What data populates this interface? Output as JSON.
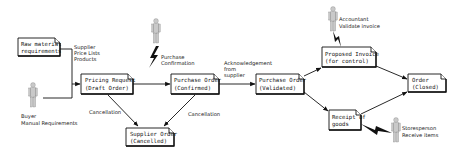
{
  "diagram": {
    "type": "workflow",
    "nodes": [
      {
        "id": "raw",
        "line1": "Raw material",
        "line2": "requirements",
        "x": 18,
        "y": 38,
        "w": 42,
        "h": 18
      },
      {
        "id": "pricing",
        "line1": "Pricing Request",
        "line2": "(Draft Order)",
        "x": 81,
        "y": 74,
        "w": 52,
        "h": 20
      },
      {
        "id": "confirmed",
        "line1": "Purchase Order",
        "line2": "(Confirmed)",
        "x": 171,
        "y": 74,
        "w": 48,
        "h": 20
      },
      {
        "id": "cancelled",
        "line1": "Supplier Order",
        "line2": "(Cancelled)",
        "x": 126,
        "y": 128,
        "w": 48,
        "h": 18
      },
      {
        "id": "validated",
        "line1": "Purchase Order",
        "line2": "(Validated)",
        "x": 256,
        "y": 74,
        "w": 48,
        "h": 20
      },
      {
        "id": "invoice",
        "line1": "Proposed Invoice",
        "line2": "(for control)",
        "x": 322,
        "y": 47,
        "w": 54,
        "h": 20
      },
      {
        "id": "order_closed",
        "line1": "Order",
        "line2": "(Closed)",
        "x": 408,
        "y": 74,
        "w": 38,
        "h": 18
      },
      {
        "id": "receipt",
        "line1": "Receipt of",
        "line2": "goods",
        "x": 329,
        "y": 110,
        "w": 32,
        "h": 20
      }
    ],
    "edge_labels": {
      "supplier_info": [
        "Supplier",
        "Price Lists",
        "Products"
      ],
      "cancel_left": "Cancellation",
      "cancel_right": "Cancellation",
      "ack": [
        "Acknowledgement",
        "from",
        "supplier"
      ],
      "purchase_confirmation": [
        "Purchase",
        "Confirmation"
      ]
    },
    "actors": [
      {
        "id": "buyer",
        "line1": "Buyer",
        "line2": "Manual Requirements"
      },
      {
        "id": "purchaser",
        "line1": "",
        "line2": ""
      },
      {
        "id": "accountant",
        "line1": "Accountant",
        "line2": "Validate invoice"
      },
      {
        "id": "storesperson",
        "line1": "Storesperson",
        "line2": "Receive items"
      }
    ]
  },
  "colors": {
    "line": "#111111",
    "box_fill": "#ffffff",
    "person": "#c9c9c9"
  }
}
